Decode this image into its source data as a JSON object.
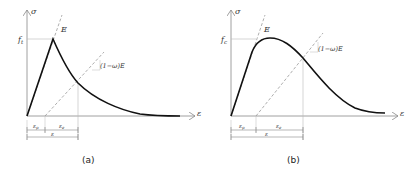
{
  "panels": [
    {
      "id": "a",
      "caption": "(a)",
      "y_axis_label": "σ",
      "x_axis_label": "ε",
      "peak_label": "f",
      "peak_subscript": "t",
      "elastic_label": "E",
      "damaged_label": "(1−ω)E",
      "dim_plastic": "ε",
      "dim_plastic_sub": "p",
      "dim_elastic": "ε",
      "dim_elastic_sub": "e",
      "dim_total": "ε",
      "curve_shape": "sharp peak then exponential softening"
    },
    {
      "id": "b",
      "caption": "(b)",
      "y_axis_label": "σ",
      "x_axis_label": "ε",
      "peak_label": "f",
      "peak_subscript": "c",
      "elastic_label": "E",
      "damaged_label": "(1−ω)E",
      "dim_plastic": "ε",
      "dim_plastic_sub": "p",
      "dim_elastic": "ε",
      "dim_elastic_sub": "e",
      "dim_total": "ε",
      "curve_shape": "rounded peak then softening"
    }
  ],
  "colors": {
    "curve": "#111111",
    "axis": "#888888",
    "dashed": "#999999",
    "guide": "#bbbbbb"
  }
}
